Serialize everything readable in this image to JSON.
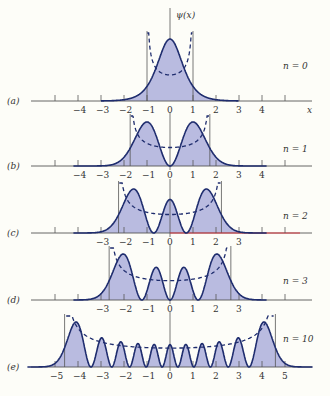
{
  "figure": {
    "y_axis_label": "ψ(x)",
    "x_axis_label": "x",
    "colors": {
      "curve": "#1f2d6e",
      "fill": "#b9bbe0",
      "axis": "#555555",
      "dashed_potential": "#1f2d6e",
      "background": "#fdfdf8",
      "highlight_line": "#e0303a",
      "highlight_tick_minus": "#2a9a3a"
    },
    "scale": {
      "origin_px": 170,
      "px_per_unit": 23
    },
    "panels": [
      {
        "id": "a",
        "label": "(a)",
        "n": 0,
        "n_label": "n = 0",
        "axis_y": 101,
        "peak_px": 62,
        "tick_labels": [
          "-4",
          "-3",
          "-2",
          "-1",
          "0",
          "1",
          "2",
          "3",
          "4"
        ],
        "show_x_label": true
      },
      {
        "id": "b",
        "label": "(b)",
        "n": 1,
        "n_label": "n = 1",
        "axis_y": 166,
        "peak_px": 44,
        "tick_labels": [
          "-4",
          "-3",
          "-2",
          "-1",
          "0",
          "1",
          "2",
          "3",
          "4"
        ],
        "show_x_label": false
      },
      {
        "id": "c",
        "label": "(c)",
        "n": 2,
        "n_label": "n = 2",
        "axis_y": 233,
        "peak_px": 44,
        "tick_labels": [
          "-3",
          "-2",
          "-1",
          "0",
          "1",
          "2",
          "3"
        ],
        "show_x_label": false
      },
      {
        "id": "d",
        "label": "(d)",
        "n": 3,
        "n_label": "n = 3",
        "axis_y": 300,
        "peak_px": 46,
        "tick_labels": [
          "-3",
          "-2",
          "-1",
          "0",
          "1",
          "2",
          "3"
        ],
        "show_x_label": false
      },
      {
        "id": "e",
        "label": "(e)",
        "n": 10,
        "n_label": "n = 10",
        "axis_y": 367,
        "peak_px": 45,
        "tick_labels": [
          "-5",
          "-4",
          "-3",
          "-2",
          "-1",
          "0",
          "1",
          "2",
          "3",
          "4",
          "5"
        ],
        "show_x_label": false
      }
    ]
  }
}
